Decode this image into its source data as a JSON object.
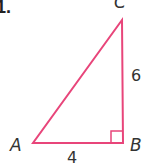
{
  "problem": {
    "number": "1."
  },
  "triangle": {
    "stroke_color": "#e8457a",
    "vertices": {
      "A": {
        "label": "A",
        "x": 33,
        "y": 143
      },
      "B": {
        "label": "B",
        "x": 123,
        "y": 143
      },
      "C": {
        "label": "C",
        "x": 122,
        "y": 20
      }
    },
    "sides": {
      "AB": {
        "label": "4"
      },
      "BC": {
        "label": "6"
      }
    },
    "right_angle_at": "B"
  }
}
